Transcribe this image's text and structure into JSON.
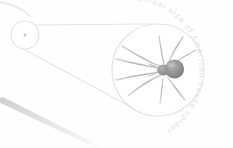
{
  "diagram": {
    "title": "actual size of American house spider",
    "subject": "American house spider",
    "caption_text": "actual size of American house spider",
    "type": "magnification-callout",
    "background_color": "#fefefe",
    "line_color": "#e4e4e6",
    "text_color": "#e2e2e4",
    "spider_body_color": "#8a8a8a",
    "spider_highlight_color": "#b9b9b9",
    "spider_leg_color": "#bdbdbd",
    "actual_size_circle": {
      "label": "actual-size-reference",
      "center_x": 25,
      "center_y": 35,
      "radius": 14,
      "dot_label": "spider-at-actual-size",
      "dot_radius": 1.4
    },
    "magnified_circle": {
      "label": "magnified-view",
      "center_x": 158,
      "center_y": 70,
      "radius": 46
    },
    "callout_lines": [
      {
        "label": "upper-tangent",
        "x1": 33,
        "y1": 25,
        "x2": 152,
        "y2": 24
      },
      {
        "label": "lower-tangent",
        "x1": 18,
        "y1": 46,
        "x2": 140,
        "y2": 112
      }
    ],
    "corner_wedge": {
      "label": "foreground-leg-wedge"
    },
    "text_arc": {
      "radius": 62,
      "start_angle_deg": -118,
      "sweep": 1
    }
  }
}
